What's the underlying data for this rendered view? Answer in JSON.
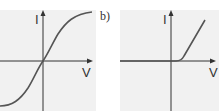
{
  "top_text_fragment": "",
  "panels": [
    {
      "id": "a",
      "label": "",
      "y_axis_label": "I",
      "x_axis_label": "V",
      "curve": "sigmoid through origin (symmetric saturation)"
    },
    {
      "id": "b",
      "label": "b)",
      "y_axis_label": "I",
      "x_axis_label": "V",
      "curve": "zero for V below threshold, then linear rise (diode-like)"
    }
  ],
  "colors": {
    "panel_bg": "#f1f1f1",
    "axis": "#333333",
    "curve": "#555555"
  }
}
